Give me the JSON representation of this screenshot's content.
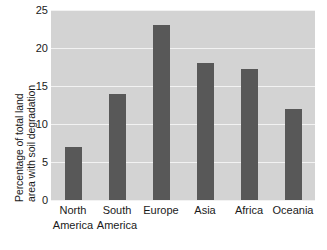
{
  "chart_data": {
    "type": "bar",
    "title": "",
    "xlabel": "",
    "ylabel": "Percentage of total land area with soil degradation",
    "ylabel_line1": "Percentage of total land",
    "ylabel_line2": "area with soil degradation",
    "categories": [
      "North America",
      "South America",
      "Europe",
      "Asia",
      "Africa",
      "Oceania"
    ],
    "category_lines": [
      [
        "North",
        "America"
      ],
      [
        "South",
        "America"
      ],
      [
        "Europe",
        ""
      ],
      [
        "Asia",
        ""
      ],
      [
        "Africa",
        ""
      ],
      [
        "Oceania",
        ""
      ]
    ],
    "values": [
      7,
      14,
      23,
      18,
      17.2,
      12
    ],
    "ylim": [
      0,
      25
    ],
    "yticks": [
      0,
      5,
      10,
      15,
      20,
      25
    ],
    "ytick_labels": [
      "0",
      "5",
      "10",
      "15",
      "20",
      "25"
    ],
    "grid": true,
    "legend": "none",
    "colors": {
      "bar": "#585858",
      "plot_background": "#d3d3d3",
      "gridline": "#f2f2f2",
      "page_background": "#ffffff",
      "text": "#1a1a1a"
    }
  }
}
